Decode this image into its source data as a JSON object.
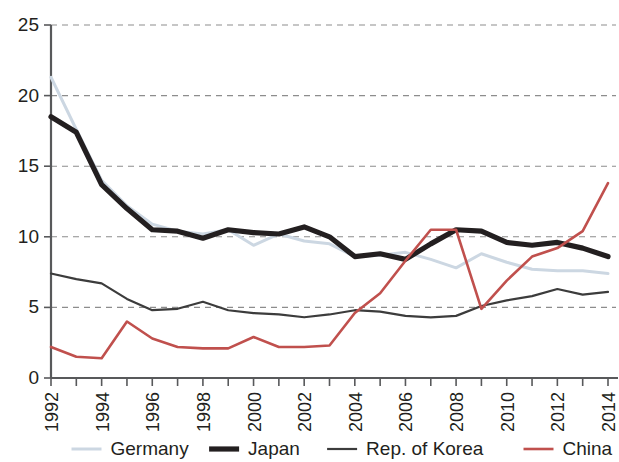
{
  "chart_data": {
    "type": "line",
    "title": "",
    "subtitle": "",
    "xlabel": "",
    "ylabel": "",
    "xlim": [
      1992,
      2014
    ],
    "ylim": [
      0,
      25
    ],
    "grid": true,
    "legend_position": "bottom",
    "y_ticks": [
      0,
      5,
      10,
      15,
      20,
      25
    ],
    "y_tick_labels": [
      "0",
      "5",
      "10",
      "15",
      "20",
      "25"
    ],
    "x_ticks": [
      1992,
      1993,
      1994,
      1995,
      1996,
      1997,
      1998,
      1999,
      2000,
      2001,
      2002,
      2003,
      2004,
      2005,
      2006,
      2007,
      2008,
      2009,
      2010,
      2011,
      2012,
      2013,
      2014
    ],
    "x_tick_labels": [
      "1992",
      "",
      "1994",
      "",
      "1996",
      "",
      "1998",
      "",
      "2000",
      "",
      "2002",
      "",
      "2004",
      "",
      "2006",
      "",
      "2008",
      "",
      "2010",
      "",
      "2012",
      "",
      "2014"
    ],
    "x": [
      1992,
      1993,
      1994,
      1995,
      1996,
      1997,
      1998,
      1999,
      2000,
      2001,
      2002,
      2003,
      2004,
      2005,
      2006,
      2007,
      2008,
      2009,
      2010,
      2011,
      2012,
      2013,
      2014
    ],
    "series": [
      {
        "name": "Germany",
        "color": "#ccd7e2",
        "width": 3.0,
        "values": [
          21.3,
          17.6,
          14.0,
          12.2,
          10.9,
          10.4,
          10.2,
          10.5,
          9.4,
          10.2,
          9.7,
          9.5,
          8.6,
          8.7,
          8.9,
          8.4,
          7.8,
          8.8,
          8.2,
          7.7,
          7.6,
          7.6,
          7.4
        ]
      },
      {
        "name": "Japan",
        "color": "#231f20",
        "width": 5.2,
        "values": [
          18.5,
          17.4,
          13.7,
          12.0,
          10.5,
          10.4,
          9.9,
          10.5,
          10.3,
          10.2,
          10.7,
          10.0,
          8.6,
          8.8,
          8.4,
          9.5,
          10.5,
          10.4,
          9.6,
          9.4,
          9.6,
          9.2,
          8.6
        ]
      },
      {
        "name": "Rep. of Korea",
        "color": "#3c3c3c",
        "width": 2.2,
        "values": [
          7.4,
          7.0,
          6.7,
          5.6,
          4.8,
          4.9,
          5.4,
          4.8,
          4.6,
          4.5,
          4.3,
          4.5,
          4.8,
          4.7,
          4.4,
          4.3,
          4.4,
          5.1,
          5.5,
          5.8,
          6.3,
          5.9,
          6.1
        ]
      },
      {
        "name": "China",
        "color": "#c0504d",
        "width": 2.6,
        "values": [
          2.2,
          1.5,
          1.4,
          4.0,
          2.8,
          2.2,
          2.1,
          2.1,
          2.9,
          2.2,
          2.2,
          2.3,
          4.6,
          6.0,
          8.3,
          10.5,
          10.5,
          4.9,
          6.9,
          8.6,
          9.2,
          10.4,
          13.8
        ]
      }
    ]
  },
  "legend": {
    "items": [
      {
        "label": "Germany",
        "color": "#ccd7e2",
        "width": 3.0
      },
      {
        "label": "Japan",
        "color": "#231f20",
        "width": 5.2
      },
      {
        "label": "Rep. of Korea",
        "color": "#3c3c3c",
        "width": 2.2
      },
      {
        "label": "China",
        "color": "#c0504d",
        "width": 2.6
      }
    ]
  }
}
